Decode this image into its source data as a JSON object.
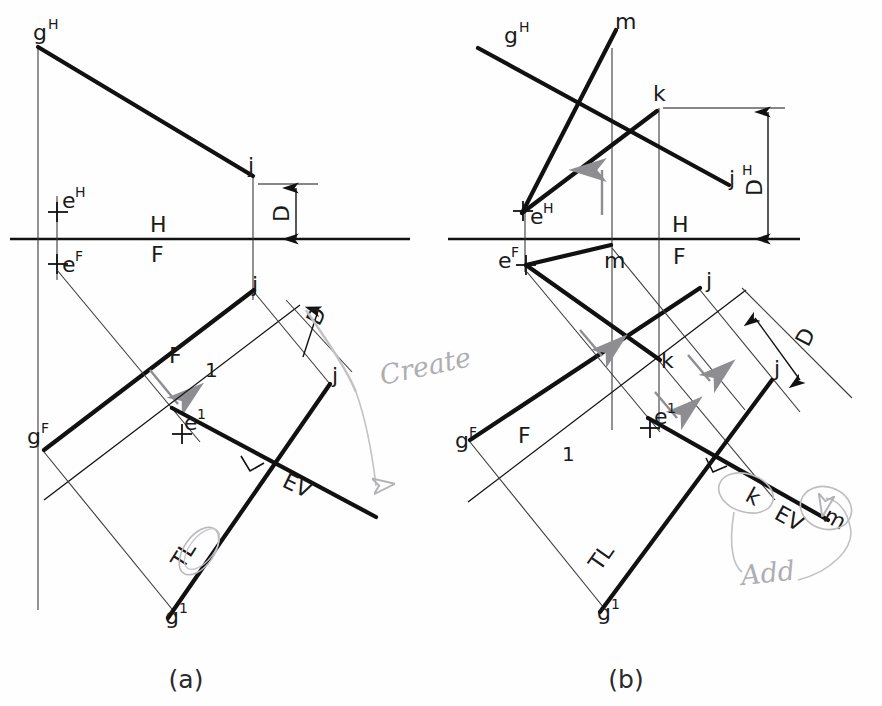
{
  "figure": {
    "panels": [
      {
        "id": "a",
        "caption": "(a)"
      },
      {
        "id": "b",
        "caption": "(b)"
      }
    ],
    "colors": {
      "ink": "#111111",
      "thin": "#3a3a3a",
      "pencil": "#b3b3b7",
      "paper": "#fefefe"
    }
  },
  "panel_a": {
    "caption": "(a)",
    "labels": {
      "g_h": "g",
      "g_h_sup": "H",
      "g_f": "g",
      "g_f_sup": "F",
      "g_1": "g",
      "g_1_sup": "1",
      "j_h": "j",
      "j_f": "j",
      "j_1": "j",
      "e_h": "e",
      "e_h_sup": "H",
      "e_f": "e",
      "e_f_sup": "F",
      "e_1": "e",
      "e_1_sup": "1",
      "fold_hf_top": "H",
      "fold_hf_bottom": "F",
      "fold_f1_top": "F",
      "fold_f1_bottom": "1",
      "dim_top": "D",
      "dim_aux": "D",
      "edge_view": "EV",
      "true_length": "TL"
    },
    "annotation": {
      "text": "Create",
      "style": "handwritten-pencil"
    }
  },
  "panel_b": {
    "caption": "(b)",
    "labels": {
      "g_h": "g",
      "g_h_sup": "H",
      "g_f": "g",
      "g_f_sup": "F",
      "g_1": "g",
      "g_1_sup": "1",
      "j_h": "j",
      "j_h_sup": "H",
      "j_f": "j",
      "j_1": "j",
      "e_h": "e",
      "e_h_sup": "H",
      "e_f": "e",
      "e_f_sup": "F",
      "e_1": "e",
      "e_1_sup": "1",
      "k_h": "k",
      "k_f": "k",
      "k_1": "k",
      "m_h": "m",
      "m_f": "m",
      "m_1": "m",
      "fold_hf_top": "H",
      "fold_hf_bottom": "F",
      "fold_f1_top": "F",
      "fold_f1_bottom": "1",
      "dim_top": "D",
      "dim_aux": "D",
      "edge_view": "EV",
      "true_length": "TL"
    },
    "annotation": {
      "text": "Add",
      "style": "handwritten-pencil"
    }
  }
}
